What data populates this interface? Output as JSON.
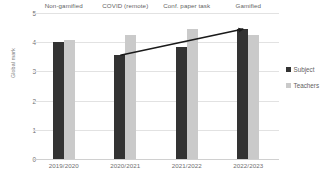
{
  "chart_data": {
    "type": "bar",
    "title": "",
    "xlabel": "",
    "ylabel": "Global mark",
    "ylim": [
      0,
      5
    ],
    "yticks": [
      0,
      1,
      2,
      3,
      4,
      5
    ],
    "ytick_labels": [
      "0",
      "1",
      "2",
      "3",
      "4",
      "5"
    ],
    "grid": true,
    "categories": [
      "2019/2020",
      "2020/2021",
      "2021/2022",
      "2022/2023"
    ],
    "series": [
      {
        "name": "Subject",
        "color": "#333333",
        "values": [
          4.02,
          3.55,
          3.82,
          4.45
        ]
      },
      {
        "name": "Teachers",
        "color": "#cacaca",
        "values": [
          4.06,
          4.25,
          4.45,
          4.24
        ]
      }
    ],
    "group_annotations": [
      "Non-gamified",
      "COVID (remote)",
      "Conf. paper task",
      "Gamified"
    ],
    "annotations": [
      {
        "type": "arrow",
        "label": "",
        "from": {
          "x": "2020/2021",
          "y": 3.55
        },
        "to": {
          "x": "2022/2023",
          "y": 4.45
        },
        "color": "#1a1a1a"
      }
    ],
    "legend": {
      "position": "right",
      "entries": [
        {
          "label": "Subject",
          "color": "#333333"
        },
        {
          "label": "Teachers",
          "color": "#cacaca"
        }
      ]
    }
  }
}
